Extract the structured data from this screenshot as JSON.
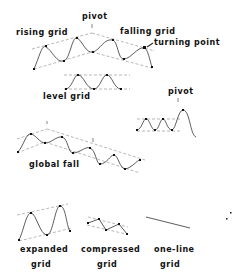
{
  "labels": {
    "pivot_top": "pivot",
    "rising_grid": "rising grid",
    "falling_grid": "falling grid",
    "turning_point": "turning point",
    "level_grid": "level grid",
    "pivot_right": "pivot",
    "global_fall": "global fall",
    "expanded": "expanded",
    "expanded_grid": "grid",
    "compressed": "compressed",
    "compressed_grid": "grid",
    "one_line": "one-line",
    "one_line_grid": "grid"
  },
  "colors": {
    "line": "#333333",
    "dashed": "#777777",
    "text": "#111111"
  }
}
